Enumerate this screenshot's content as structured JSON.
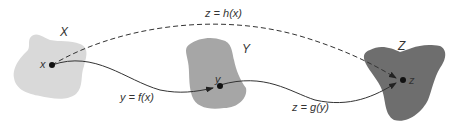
{
  "diagram": {
    "sets": [
      {
        "id": "X",
        "label": "X",
        "color": "#d9d9d9"
      },
      {
        "id": "Y",
        "label": "Y",
        "color": "#a6a6a6"
      },
      {
        "id": "Z",
        "label": "Z",
        "color": "#6e6e6e"
      }
    ],
    "points": [
      {
        "id": "x",
        "label": "x"
      },
      {
        "id": "y",
        "label": "y"
      },
      {
        "id": "z",
        "label": "z"
      }
    ],
    "arrows": [
      {
        "id": "f",
        "from": "x",
        "to": "y",
        "label": "y = f(x)",
        "style": "solid"
      },
      {
        "id": "g",
        "from": "y",
        "to": "z",
        "label": "z = g(y)",
        "style": "solid"
      },
      {
        "id": "h",
        "from": "x",
        "to": "z",
        "label": "z = h(x)",
        "style": "dashed"
      }
    ]
  }
}
